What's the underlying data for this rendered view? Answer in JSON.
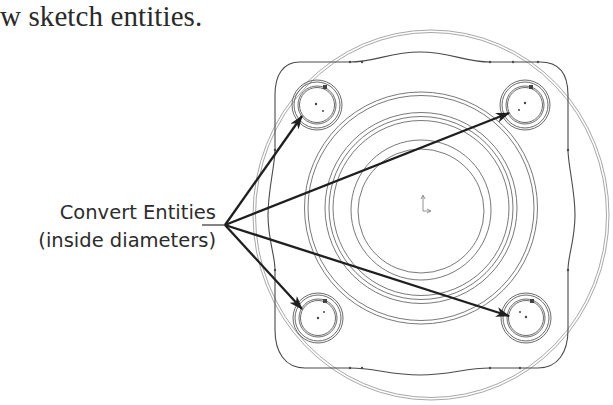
{
  "caption": {
    "top_text": "w sketch entities."
  },
  "callout": {
    "line1": "Convert Entities",
    "line2": "(inside diameters)",
    "origin": [
      225,
      225
    ]
  },
  "drawing": {
    "type": "cad-sketch-flange-top-view",
    "center": [
      421,
      208
    ],
    "outer_circle": {
      "cx": 431,
      "cy": 215,
      "r": 180
    },
    "concentric_rings_radii": [
      116,
      113,
      96,
      92,
      88,
      70,
      63
    ],
    "flange_outline": {
      "left": 275,
      "right": 568,
      "top": 60,
      "bottom": 370
    },
    "holes": [
      {
        "name": "top-left",
        "cx": 317,
        "cy": 105,
        "r_outer": 25,
        "r_inner": 19
      },
      {
        "name": "top-right",
        "cx": 525,
        "cy": 105,
        "r_outer": 25,
        "r_inner": 19
      },
      {
        "name": "bottom-left",
        "cx": 318,
        "cy": 318,
        "r_outer": 25,
        "r_inner": 19
      },
      {
        "name": "bottom-right",
        "cx": 526,
        "cy": 318,
        "r_outer": 25,
        "r_inner": 19
      }
    ],
    "arrows": [
      {
        "target": "top-left",
        "tip": [
          302,
          116
        ]
      },
      {
        "target": "top-right",
        "tip": [
          509,
          113
        ]
      },
      {
        "target": "bottom-left",
        "tip": [
          302,
          309
        ]
      },
      {
        "target": "bottom-right",
        "tip": [
          509,
          316
        ]
      }
    ],
    "colors": {
      "line": "#555555",
      "light_line": "#9a9a9a",
      "arrow": "#1f1f1f"
    }
  }
}
